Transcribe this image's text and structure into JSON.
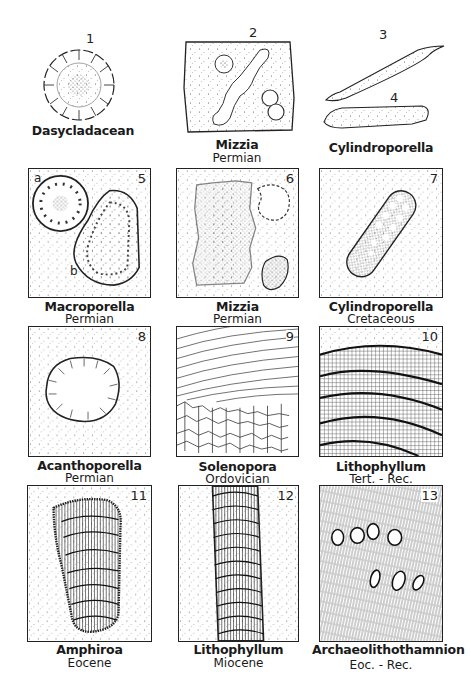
{
  "figures": [
    {
      "num": "1",
      "genus": "Dasycladacean",
      "age": ""
    },
    {
      "num": "2",
      "genus": "Mizzia",
      "age": "Permian"
    },
    {
      "num": "3",
      "num2": "4",
      "genus": "Cylindroporella",
      "age": ""
    },
    {
      "num": "5",
      "genus": "Macroporella",
      "age": "Permian",
      "sublabels": [
        "a",
        "b"
      ]
    },
    {
      "num": "6",
      "genus": "Mizzia",
      "age": "Permian"
    },
    {
      "num": "7",
      "genus": "Cylindroporella",
      "age": "Cretaceous"
    },
    {
      "num": "8",
      "genus": "Acanthoporella",
      "age": "Permian"
    },
    {
      "num": "9",
      "genus": "Solenopora",
      "age": "Ordovician"
    },
    {
      "num": "10",
      "genus": "Lithophyllum",
      "age": "Tert. - Rec."
    },
    {
      "num": "11",
      "genus": "Amphiroa",
      "age": "Eocene"
    },
    {
      "num": "12",
      "genus": "Lithophyllum",
      "age": "Miocene"
    },
    {
      "num": "13",
      "genus": "Archaeolithothamnion",
      "age": "Eoc. - Rec."
    }
  ]
}
